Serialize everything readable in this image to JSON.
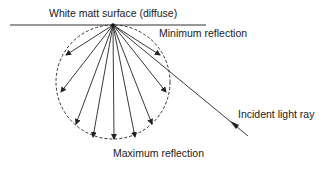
{
  "diagram": {
    "title": "White matt surface (diffuse)",
    "labels": {
      "minimum": "Minimum reflection",
      "maximum": "Maximum reflection",
      "incident": "Incident light ray"
    },
    "colors": {
      "line": "#222222",
      "background": "#ffffff"
    },
    "elements": {
      "surface_line": "horizontal surface",
      "reflection_envelope": "dashed circle (diffuse distribution)",
      "reflected_rays": 9,
      "incident_ray": "one oblique ray from lower right to the surface point"
    }
  }
}
